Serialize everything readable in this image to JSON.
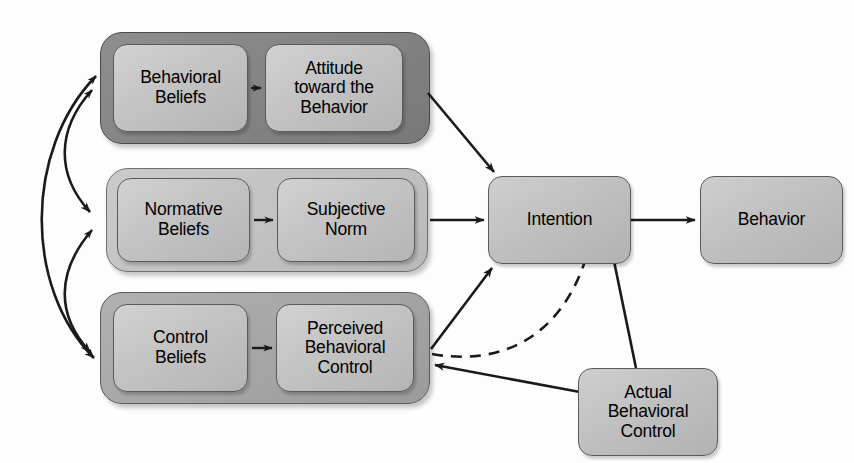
{
  "diagram": {
    "background_color": "#fdfdfd",
    "line_color": "#1a1a1a",
    "groups": [
      {
        "id": "attitude-group",
        "label": "Behavioral Beliefs / Attitude group",
        "shade": "#848484"
      },
      {
        "id": "norm-group",
        "label": "Normative Beliefs / Subjective Norm group",
        "shade": "#c2c2c2"
      },
      {
        "id": "control-group",
        "label": "Control Beliefs / Perceived Behavioral Control group",
        "shade": "#a6a6a6"
      }
    ],
    "nodes": {
      "behavioral_beliefs": "Behavioral\nBeliefs",
      "attitude": "Attitude\ntoward the\nBehavior",
      "normative_beliefs": "Normative\nBeliefs",
      "subjective_norm": "Subjective\nNorm",
      "control_beliefs": "Control\nBeliefs",
      "perceived_behavioral_control": "Perceived\nBehavioral\nControl",
      "intention": "Intention",
      "behavior": "Behavior",
      "actual_behavioral_control": "Actual\nBehavioral\nControl"
    },
    "node_lines": {
      "behavioral_beliefs": [
        "Behavioral",
        "Beliefs"
      ],
      "attitude": [
        "Attitude",
        "toward the",
        "Behavior"
      ],
      "normative_beliefs": [
        "Normative",
        "Beliefs"
      ],
      "subjective_norm": [
        "Subjective",
        "Norm"
      ],
      "control_beliefs": [
        "Control",
        "Beliefs"
      ],
      "perceived_behavioral_control": [
        "Perceived",
        "Behavioral",
        "Control"
      ],
      "intention": [
        "Intention"
      ],
      "behavior": [
        "Behavior"
      ],
      "actual_behavioral_control": [
        "Actual",
        "Behavioral",
        "Control"
      ]
    },
    "edges": [
      {
        "id": "bb-to-attitude",
        "from": "behavioral_beliefs",
        "to": "attitude",
        "style": "solid",
        "arrow": "single"
      },
      {
        "id": "nb-to-norm",
        "from": "normative_beliefs",
        "to": "subjective_norm",
        "style": "solid",
        "arrow": "single"
      },
      {
        "id": "cb-to-pbc",
        "from": "control_beliefs",
        "to": "perceived_behavioral_control",
        "style": "solid",
        "arrow": "single"
      },
      {
        "id": "attitude-to-intention",
        "from": "attitude",
        "to": "intention",
        "style": "solid",
        "arrow": "single"
      },
      {
        "id": "norm-to-intention",
        "from": "subjective_norm",
        "to": "intention",
        "style": "solid",
        "arrow": "single"
      },
      {
        "id": "pbc-to-intention",
        "from": "perceived_behavioral_control",
        "to": "intention",
        "style": "solid",
        "arrow": "single"
      },
      {
        "id": "intention-to-behavior",
        "from": "intention",
        "to": "behavior",
        "style": "solid",
        "arrow": "single"
      },
      {
        "id": "pbc-to-behavior",
        "from": "perceived_behavioral_control",
        "to": "behavior-link",
        "style": "dashed",
        "arrow": "single"
      },
      {
        "id": "abc-to-behavior",
        "from": "actual_behavioral_control",
        "to": "behavior-link",
        "style": "solid",
        "arrow": "single"
      },
      {
        "id": "abc-to-pbc",
        "from": "actual_behavioral_control",
        "to": "perceived_behavioral_control",
        "style": "solid",
        "arrow": "single"
      },
      {
        "id": "attitude-norm-correlation",
        "from": "attitude-group",
        "to": "norm-group",
        "style": "solid",
        "arrow": "double"
      },
      {
        "id": "norm-control-correlation",
        "from": "norm-group",
        "to": "control-group",
        "style": "solid",
        "arrow": "double"
      },
      {
        "id": "attitude-control-correlation",
        "from": "attitude-group",
        "to": "control-group",
        "style": "solid",
        "arrow": "double"
      }
    ]
  }
}
